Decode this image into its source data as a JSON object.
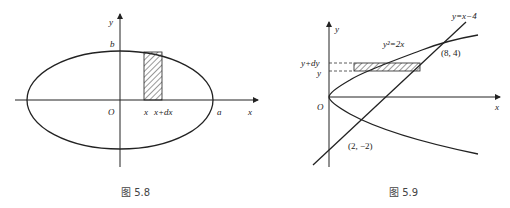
{
  "figures": [
    {
      "id": "fig-5-8",
      "caption": "图 5.8",
      "labels": {
        "y_axis": "y",
        "x_axis": "x",
        "origin": "O",
        "b": "b",
        "a": "a",
        "strip_left": "x",
        "strip_right": "x+dx"
      }
    },
    {
      "id": "fig-5-9",
      "caption": "图 5.9",
      "labels": {
        "y_axis": "y",
        "x_axis": "x",
        "origin": "O",
        "parabola": "y²=2x",
        "line": "y=x−4",
        "point_upper": "(8, 4)",
        "point_lower": "(2, −2)",
        "y_plus_dy": "y+dy",
        "y": "y"
      }
    }
  ]
}
